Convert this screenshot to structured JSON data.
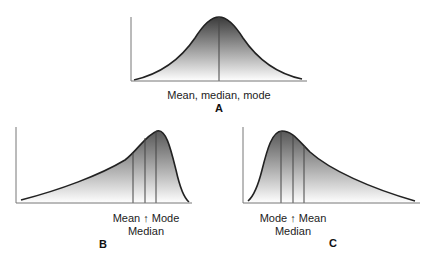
{
  "colors": {
    "curve": "#222222",
    "fill_dark": "#3a3a3a",
    "fill_light": "#ffffff",
    "axis": "#777777"
  },
  "panels": [
    {
      "id": "A",
      "panel_label": "A",
      "shape": "symmetric (normal)",
      "label_line1": "Mean, median, mode",
      "label_line2": ""
    },
    {
      "id": "B",
      "panel_label": "B",
      "shape": "negatively skewed (left tail)",
      "label_line1": "Mean ↑ Mode",
      "label_line2": "Median",
      "line_order": [
        "Mean",
        "Median",
        "Mode"
      ]
    },
    {
      "id": "C",
      "panel_label": "C",
      "shape": "positively skewed (right tail)",
      "label_line1": "Mode ↑ Mean",
      "label_line2": "Median",
      "line_order": [
        "Mode",
        "Median",
        "Mean"
      ]
    }
  ]
}
